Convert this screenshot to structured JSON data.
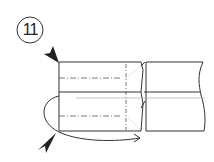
{
  "diagram": {
    "type": "origami-fold-instruction",
    "step_number": "11",
    "colors": {
      "line": "#333333",
      "light_line": "#aaaaaa",
      "background": "#ffffff"
    },
    "elements": [
      "step-number-circle",
      "top-push-arrow",
      "bottom-push-arrow",
      "folded-left-section",
      "valley-fold-lines",
      "vertical-crease-line",
      "right-section-with-torn-edge",
      "rotation-arrow"
    ]
  }
}
